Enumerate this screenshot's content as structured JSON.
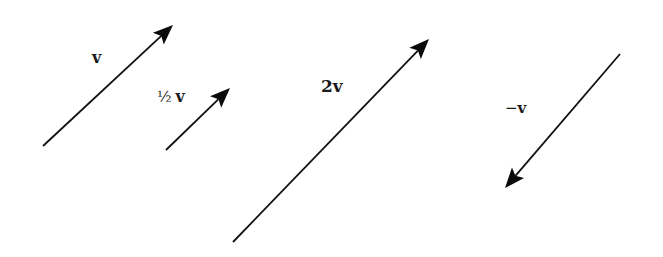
{
  "diagram": {
    "background": "#ffffff",
    "stroke_color": "#111111",
    "vectors": [
      {
        "id": "v",
        "label": "v",
        "tail": [
          43,
          146
        ],
        "tip": [
          173,
          25
        ]
      },
      {
        "id": "half_v",
        "label_fraction": "½",
        "label_symbol": "v",
        "tail": [
          166,
          150
        ],
        "tip": [
          230,
          88
        ]
      },
      {
        "id": "two_v",
        "label": "2v",
        "tail": [
          233,
          242
        ],
        "tip": [
          429,
          39
        ]
      },
      {
        "id": "neg_v",
        "label_sign": "−",
        "label_symbol": "v",
        "tail": [
          620,
          54
        ],
        "tip": [
          505,
          188
        ]
      }
    ]
  }
}
